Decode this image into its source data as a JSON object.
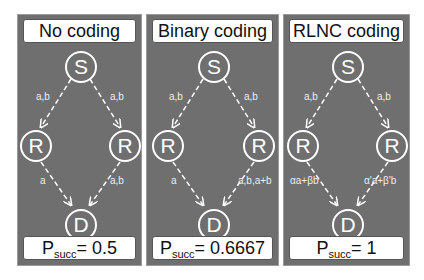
{
  "panels": [
    {
      "title": "No coding",
      "nodes": {
        "source": "S",
        "relay_left": "R",
        "relay_right": "R",
        "destination": "D"
      },
      "edges": {
        "s_to_left": "a,b",
        "s_to_right": "a,b",
        "left_to_d": "a",
        "right_to_d": "a,b"
      },
      "result": {
        "prefix": "P",
        "subscript": "succ",
        "value": "= 0.5"
      }
    },
    {
      "title": "Binary coding",
      "nodes": {
        "source": "S",
        "relay_left": "R",
        "relay_right": "R",
        "destination": "D"
      },
      "edges": {
        "s_to_left": "a,b",
        "s_to_right": "a,b",
        "left_to_d": "a",
        "right_to_d": "a,b,a+b"
      },
      "result": {
        "prefix": "P",
        "subscript": "succ",
        "value": "= 0.6667"
      }
    },
    {
      "title": "RLNC coding",
      "nodes": {
        "source": "S",
        "relay_left": "R",
        "relay_right": "R",
        "destination": "D"
      },
      "edges": {
        "s_to_left": "a,b",
        "s_to_right": "a,b",
        "left_to_d": "αa+βb",
        "right_to_d": "α'a+β'b"
      },
      "result": {
        "prefix": "P",
        "subscript": "succ",
        "value": "= 1"
      }
    }
  ]
}
